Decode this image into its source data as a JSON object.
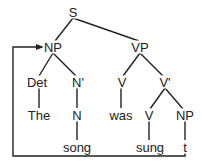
{
  "diagram": {
    "type": "syntax-tree",
    "colors": {
      "line": "#222222",
      "text": "#222222",
      "background": "#ffffff"
    },
    "nodes": {
      "s": {
        "label": "S",
        "x": 73,
        "y": 12
      },
      "np": {
        "label": "NP",
        "x": 53,
        "y": 47
      },
      "vp": {
        "label": "VP",
        "x": 140,
        "y": 47
      },
      "det": {
        "label": "Det",
        "x": 37,
        "y": 82
      },
      "nbar": {
        "label": "N'",
        "x": 78,
        "y": 82
      },
      "v": {
        "label": "V",
        "x": 122,
        "y": 82
      },
      "vbar": {
        "label": "V'",
        "x": 165,
        "y": 82
      },
      "the": {
        "label": "The",
        "x": 39,
        "y": 115
      },
      "n": {
        "label": "N",
        "x": 77,
        "y": 115
      },
      "was": {
        "label": "was",
        "x": 121,
        "y": 115
      },
      "v2": {
        "label": "V",
        "x": 149,
        "y": 115
      },
      "np2": {
        "label": "NP",
        "x": 185,
        "y": 115
      },
      "song": {
        "label": "song",
        "x": 77,
        "y": 147
      },
      "sung": {
        "label": "sung",
        "x": 150,
        "y": 147
      },
      "trace": {
        "label": "t",
        "x": 185,
        "y": 147
      }
    },
    "movement_arrow": {
      "from": "trace",
      "to": "np"
    }
  }
}
